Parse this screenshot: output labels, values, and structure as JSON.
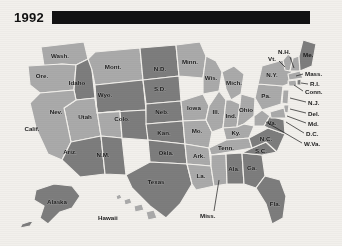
{
  "figure": {
    "year": "1992",
    "title_bar": "solid-black-banner"
  },
  "palette": {
    "background": "#f2f0ec",
    "dark_state": "#7d7d7d",
    "light_state": "#aaaaaa",
    "border": "#f2f0ec",
    "text": "#1b1b1b",
    "banner": "#121212"
  },
  "legend_tones": {
    "dark": "#7d7d7d",
    "light": "#aaaaaa"
  },
  "states": [
    {
      "code": "WA",
      "label": "Wash.",
      "tone": "light",
      "lx": 60,
      "ly": 30
    },
    {
      "code": "OR",
      "label": "Ore.",
      "tone": "light",
      "lx": 42,
      "ly": 50
    },
    {
      "code": "ID",
      "label": "Idaho",
      "tone": "dark",
      "lx": 77,
      "ly": 57
    },
    {
      "code": "MT",
      "label": "Mont.",
      "tone": "light",
      "lx": 113,
      "ly": 41
    },
    {
      "code": "WY",
      "label": "Wyo.",
      "tone": "dark",
      "lx": 105,
      "ly": 69
    },
    {
      "code": "NV",
      "label": "Nev.",
      "tone": "light",
      "lx": 56,
      "ly": 86
    },
    {
      "code": "UT",
      "label": "Utah",
      "tone": "light",
      "lx": 85,
      "ly": 91
    },
    {
      "code": "CA",
      "label": "Calif.",
      "tone": "light",
      "lx": 32,
      "ly": 103
    },
    {
      "code": "AZ",
      "label": "Ariz.",
      "tone": "dark",
      "lx": 70,
      "ly": 126
    },
    {
      "code": "NM",
      "label": "N.M.",
      "tone": "dark",
      "lx": 103,
      "ly": 129
    },
    {
      "code": "CO",
      "label": "Colo.",
      "tone": "dark",
      "lx": 122,
      "ly": 93
    },
    {
      "code": "ND",
      "label": "N.D.",
      "tone": "dark",
      "lx": 155,
      "ly": 43
    },
    {
      "code": "SD",
      "label": "S.D.",
      "tone": "dark",
      "lx": 155,
      "ly": 63
    },
    {
      "code": "NE",
      "label": "Neb.",
      "tone": "dark",
      "lx": 154,
      "ly": 84
    },
    {
      "code": "KS",
      "label": "Kan.",
      "tone": "dark",
      "lx": 158,
      "ly": 106
    },
    {
      "code": "OK",
      "label": "Okla.",
      "tone": "dark",
      "lx": 164,
      "ly": 126
    },
    {
      "code": "TX",
      "label": "Texas",
      "tone": "dark",
      "lx": 153,
      "ly": 152
    },
    {
      "code": "MN",
      "label": "Minn.",
      "tone": "light",
      "lx": 187,
      "ly": 41
    },
    {
      "code": "IA",
      "label": "Iowa",
      "tone": "light",
      "lx": 188,
      "ly": 78
    },
    {
      "code": "MO",
      "label": "Mo.",
      "tone": "light",
      "lx": 196,
      "ly": 105
    },
    {
      "code": "AR",
      "label": "Ark.",
      "tone": "light",
      "lx": 198,
      "ly": 128
    },
    {
      "code": "LA",
      "label": "La.",
      "tone": "light",
      "lx": 203,
      "ly": 150
    },
    {
      "code": "WI",
      "label": "Wis.",
      "tone": "light",
      "lx": 208,
      "ly": 53
    },
    {
      "code": "IL",
      "label": "Ill.",
      "tone": "light",
      "lx": 213,
      "ly": 83
    },
    {
      "code": "MI",
      "label": "Mich.",
      "tone": "light",
      "lx": 228,
      "ly": 65
    },
    {
      "code": "IN",
      "label": "Ind.",
      "tone": "light",
      "lx": 228,
      "ly": 93
    },
    {
      "code": "OH",
      "label": "Ohio",
      "tone": "light",
      "lx": 243,
      "ly": 89
    },
    {
      "code": "KY",
      "label": "Ky.",
      "tone": "light",
      "lx": 235,
      "ly": 107
    },
    {
      "code": "TN",
      "label": "Tenn.",
      "tone": "light",
      "lx": 229,
      "ly": 123
    },
    {
      "code": "MS",
      "label": "Miss.",
      "tone": "light",
      "lx": 0,
      "ly": 0
    },
    {
      "code": "AL",
      "label": "Ala.",
      "tone": "dark",
      "lx": 232,
      "ly": 145
    },
    {
      "code": "GA",
      "label": "Ga.",
      "tone": "dark",
      "lx": 250,
      "ly": 145
    },
    {
      "code": "FL",
      "label": "Fla.",
      "tone": "dark",
      "lx": 272,
      "ly": 180
    },
    {
      "code": "SC",
      "label": "S.C.",
      "tone": "dark",
      "lx": 259,
      "ly": 133
    },
    {
      "code": "NC",
      "label": "N.C.",
      "tone": "dark",
      "lx": 262,
      "ly": 120
    },
    {
      "code": "VA",
      "label": "Va.",
      "tone": "dark",
      "lx": 258,
      "ly": 100
    },
    {
      "code": "PA",
      "label": "Pa.",
      "tone": "light",
      "lx": 252,
      "ly": 78
    },
    {
      "code": "NY",
      "label": "N.Y.",
      "tone": "light",
      "lx": 262,
      "ly": 60
    },
    {
      "code": "AK",
      "label": "Alaska",
      "tone": "dark",
      "lx": 57,
      "ly": 182
    },
    {
      "code": "HI",
      "label": "Hawaii",
      "tone": "light",
      "lx": 0,
      "ly": 0
    }
  ],
  "callout_labels": [
    {
      "code": "VT",
      "label": "Vt.",
      "x": 272,
      "y": 31
    },
    {
      "code": "NH",
      "label": "N.H.",
      "x": 283,
      "y": 25
    },
    {
      "code": "ME",
      "label": "Me.",
      "x": 308,
      "y": 29
    },
    {
      "code": "MA",
      "label": "Mass.",
      "x": 305,
      "y": 46
    },
    {
      "code": "RI",
      "label": "R.I.",
      "x": 310,
      "y": 57
    },
    {
      "code": "CT",
      "label": "Conn.",
      "x": 305,
      "y": 65
    },
    {
      "code": "NJ",
      "label": "N.J.",
      "x": 308,
      "y": 76
    },
    {
      "code": "DE",
      "label": "Del.",
      "x": 308,
      "y": 87
    },
    {
      "code": "MD",
      "label": "Md.",
      "x": 308,
      "y": 97
    },
    {
      "code": "DC",
      "label": "D.C.",
      "x": 306,
      "y": 107
    },
    {
      "code": "WV",
      "label": "W.Va.",
      "x": 304,
      "y": 117
    },
    {
      "code": "MS",
      "label": "Miss.",
      "x": 200,
      "y": 188
    },
    {
      "code": "HI",
      "label": "Hawaii",
      "x": 98,
      "y": 191
    }
  ]
}
